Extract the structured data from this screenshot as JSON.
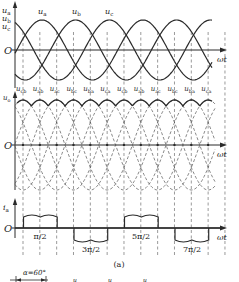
{
  "figure": {
    "caption": "(a)",
    "top_plot": {
      "y_axis_labels": [
        "u_a",
        "u_b",
        "u_c"
      ],
      "curve_labels": [
        "u_a",
        "u_b",
        "u_c"
      ],
      "origin": "O",
      "x_axis_label": "ωt"
    },
    "middle_plot": {
      "y_axis_label": "u_o",
      "segment_labels": [
        "u_cb",
        "u_ab",
        "u_ac",
        "u_bc",
        "u_ba",
        "u_ca",
        "u_cb",
        "u_ab",
        "u_ac",
        "u_bc",
        "u_ba",
        "u_ca"
      ],
      "origin": "O",
      "x_axis_label": "ωt"
    },
    "bottom_plot": {
      "y_axis_label": "i_a",
      "origin": "O",
      "x_axis_label": "ωt",
      "tick_labels": [
        "π/2",
        "3π/2",
        "5π/2",
        "7π/2"
      ]
    },
    "next_figure_hint": {
      "label": "α=60°"
    }
  },
  "colors": {
    "line": "#2a2a2a",
    "dashed": "#555555",
    "background": "#ffffff"
  }
}
